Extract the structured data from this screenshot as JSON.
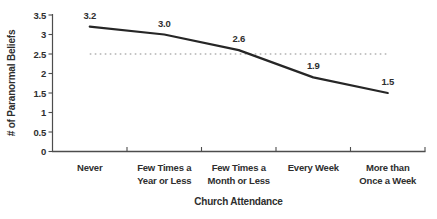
{
  "chart_data": {
    "type": "line",
    "title": "",
    "xlabel": "Church Attendance",
    "ylabel": "# of Paranormal Beliefs",
    "categories": [
      "Never",
      "Few Times a Year or Less",
      "Few Times a Month or Less",
      "Every Week",
      "More than Once a Week"
    ],
    "categories_display": [
      "Never",
      "Few Times a\nYear or Less",
      "Few Times a\nMonth or Less",
      "Every Week",
      "More than\nOnce a Week"
    ],
    "series": [
      {
        "name": "# of Paranormal Beliefs",
        "values": [
          3.2,
          3.0,
          2.6,
          1.9,
          1.5
        ]
      }
    ],
    "data_labels": [
      "3.2",
      "3.0",
      "2.6",
      "1.9",
      "1.5"
    ],
    "y_ticks": [
      0,
      0.5,
      1,
      1.5,
      2,
      2.5,
      3,
      3.5
    ],
    "y_tick_labels": [
      "0",
      "0.5",
      "1",
      "1.5",
      "2",
      "2.5",
      "3",
      "3.5"
    ],
    "ylim": [
      0,
      3.5
    ],
    "reference_line": {
      "value": 2.5,
      "style": "dotted"
    },
    "grid": "off",
    "legend": "none",
    "colors": {
      "line": "#262626",
      "reference": "#8a8a8a",
      "axis": "#4d4d4d",
      "text": "#2e2e2e",
      "background": "#ffffff"
    }
  }
}
